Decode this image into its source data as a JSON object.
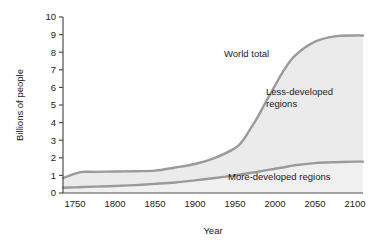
{
  "chart_data": {
    "type": "area",
    "title": "",
    "xlabel": "Year",
    "ylabel": "Billions of people",
    "xlim": [
      1735,
      2110
    ],
    "ylim": [
      0,
      10
    ],
    "grid": false,
    "legend": "inline-annotations",
    "xticks": [
      1750,
      1800,
      1850,
      1900,
      1950,
      2000,
      2050,
      2100
    ],
    "xtick_labels": [
      "1750",
      "1800",
      "1850",
      "1900",
      "1950",
      "2000",
      "2050",
      "2100"
    ],
    "yticks": [
      0,
      1,
      2,
      3,
      4,
      5,
      6,
      7,
      8,
      9,
      10
    ],
    "ytick_labels": [
      "0",
      "1",
      "2",
      "3",
      "4",
      "5",
      "6",
      "7",
      "8",
      "9",
      "10"
    ],
    "x": [
      1735,
      1750,
      1760,
      1775,
      1800,
      1825,
      1850,
      1875,
      1900,
      1925,
      1950,
      1960,
      1970,
      1975,
      1980,
      1990,
      2000,
      2010,
      2025,
      2050,
      2075,
      2100,
      2110
    ],
    "series": [
      {
        "name": "World total",
        "label": "World total",
        "color": "#9a9a9a",
        "values": [
          0.85,
          1.1,
          1.2,
          1.2,
          1.22,
          1.24,
          1.27,
          1.45,
          1.65,
          2.0,
          2.55,
          3.0,
          3.7,
          4.05,
          4.45,
          5.3,
          6.1,
          6.9,
          7.8,
          8.6,
          8.9,
          8.95,
          8.95
        ]
      },
      {
        "name": "More-developed regions",
        "label": "More-developed regions",
        "color": "#9a9a9a",
        "values": [
          0.3,
          0.32,
          0.34,
          0.36,
          0.4,
          0.45,
          0.52,
          0.6,
          0.72,
          0.85,
          1.0,
          1.08,
          1.15,
          1.18,
          1.22,
          1.3,
          1.38,
          1.45,
          1.58,
          1.7,
          1.75,
          1.78,
          1.78
        ]
      }
    ],
    "band_label": "Less-developed regions",
    "annotations": [
      {
        "text": "World total",
        "x": 1975,
        "y": 7.6
      },
      {
        "text": "Less-developed regions",
        "x": 2022,
        "y": 5.5
      },
      {
        "text": "More-developed regions",
        "x": 2040,
        "y": 1.0
      }
    ],
    "colors": {
      "line": "#9a9a9a",
      "axis": "#4d4d4d",
      "plot_background": "#f4f4f4",
      "band_fill": "#ebebeb",
      "text": "#1a1a1a"
    }
  },
  "labels": {
    "world_total": "World total",
    "less_developed_line1": "Less-developed",
    "less_developed_line2": "regions",
    "more_developed": "More-developed regions",
    "y_axis_title": "Billions of people",
    "x_axis_title": "Year"
  }
}
